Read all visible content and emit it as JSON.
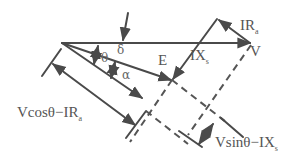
{
  "diagram": {
    "labels": {
      "IRa": {
        "main": "IR",
        "sub": "a"
      },
      "V": {
        "main": "V"
      },
      "E": {
        "main": "E"
      },
      "IXs": {
        "main": "IX",
        "sub": "s"
      },
      "delta": "δ",
      "theta": "θ",
      "alpha": "α",
      "vcos": {
        "main": "Vcosθ−IR",
        "sub": "a"
      },
      "vsin": {
        "main": "Vsinθ−IX",
        "sub": "s"
      }
    },
    "colors": {
      "stroke": "#4a4a4a",
      "text": "#555555"
    }
  }
}
